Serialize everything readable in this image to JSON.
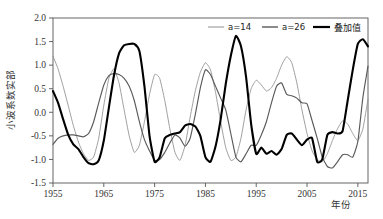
{
  "chart_data": {
    "type": "line",
    "title": "",
    "xlabel": "年份",
    "ylabel": "小波系数实部",
    "xlim": [
      1955,
      2017
    ],
    "ylim": [
      -1.5,
      2.0
    ],
    "grid": false,
    "legend_position": "top-right",
    "xticks": [
      "1955",
      "1965",
      "1975",
      "1985",
      "1995",
      "2005",
      "2015"
    ],
    "xtick_values": [
      1955,
      1965,
      1975,
      1985,
      1995,
      2005,
      2015
    ],
    "yticks": [
      "2.0",
      "1.5",
      "1.0",
      "0.5",
      "0.0",
      "-0.5",
      "-1.0",
      "-1.5"
    ],
    "ytick_values": [
      2.0,
      1.5,
      1.0,
      0.5,
      0.0,
      -0.5,
      -1.0,
      -1.5
    ],
    "x": [
      1955,
      1956,
      1957,
      1958,
      1959,
      1960,
      1961,
      1962,
      1963,
      1964,
      1965,
      1966,
      1967,
      1968,
      1969,
      1970,
      1971,
      1972,
      1973,
      1974,
      1975,
      1976,
      1977,
      1978,
      1979,
      1980,
      1981,
      1982,
      1983,
      1984,
      1985,
      1986,
      1987,
      1988,
      1989,
      1990,
      1991,
      1992,
      1993,
      1994,
      1995,
      1996,
      1997,
      1998,
      1999,
      2000,
      2001,
      2002,
      2003,
      2004,
      2005,
      2006,
      2007,
      2008,
      2009,
      2010,
      2011,
      2012,
      2013,
      2014,
      2015,
      2016,
      2017
    ],
    "series": [
      {
        "name": "a=14",
        "color": "#8f8f8f",
        "width": 0.85,
        "values": [
          1.19,
          0.92,
          0.55,
          0.14,
          -0.28,
          -0.63,
          -0.88,
          -1.02,
          -0.95,
          -0.55,
          0.15,
          0.72,
          0.92,
          0.62,
          0.05,
          -0.5,
          -0.85,
          -0.7,
          -0.2,
          0.38,
          0.8,
          0.72,
          0.25,
          -0.35,
          -0.85,
          -1.02,
          -0.7,
          -0.1,
          0.45,
          0.85,
          1.05,
          0.9,
          0.42,
          -0.2,
          -0.75,
          -1.02,
          -0.95,
          -0.55,
          0.05,
          0.5,
          0.68,
          0.58,
          0.45,
          0.52,
          0.72,
          1.0,
          1.18,
          1.05,
          0.62,
          0.05,
          -0.45,
          -0.82,
          -1.0,
          -1.05,
          -0.88,
          -0.6,
          -0.35,
          -0.18,
          -0.25,
          -0.45,
          -0.6,
          -0.35,
          0.28
        ]
      },
      {
        "name": "a=26",
        "color": "#5a5a5a",
        "width": 1.15,
        "values": [
          -0.68,
          -0.55,
          -0.5,
          -0.48,
          -0.48,
          -0.5,
          -0.52,
          -0.45,
          -0.2,
          0.2,
          0.58,
          0.78,
          0.82,
          0.8,
          0.72,
          0.55,
          0.25,
          -0.2,
          -0.58,
          -0.82,
          -1.02,
          -1.0,
          -0.85,
          -0.65,
          -0.48,
          -0.55,
          -0.72,
          -0.55,
          -0.05,
          0.52,
          0.9,
          0.8,
          0.55,
          0.3,
          0.05,
          -0.45,
          -0.95,
          -1.05,
          -0.88,
          -0.7,
          -0.7,
          -0.48,
          -0.2,
          0.2,
          0.55,
          0.62,
          0.38,
          0.35,
          0.3,
          0.2,
          0.18,
          -0.18,
          -0.55,
          -0.95,
          -1.15,
          -1.18,
          -1.05,
          -0.9,
          -0.9,
          -0.95,
          -0.62,
          0.32,
          0.98
        ]
      },
      {
        "name": "叠加值",
        "color": "#000000",
        "width": 2.1,
        "values": [
          0.45,
          0.2,
          -0.15,
          -0.48,
          -0.68,
          -0.78,
          -0.95,
          -1.08,
          -1.1,
          -1.02,
          -0.6,
          0.1,
          0.78,
          1.25,
          1.42,
          1.45,
          1.45,
          1.3,
          0.55,
          -0.5,
          -1.05,
          -0.95,
          -0.55,
          -0.48,
          -0.45,
          -0.42,
          -0.28,
          -0.25,
          -0.3,
          -0.5,
          -0.95,
          -1.05,
          -0.72,
          -0.15,
          0.6,
          1.2,
          1.62,
          1.4,
          0.75,
          -0.25,
          -0.88,
          -0.75,
          -0.88,
          -0.82,
          -0.9,
          -0.78,
          -0.48,
          -0.45,
          -0.58,
          -0.7,
          -0.58,
          -0.55,
          -1.05,
          -1.0,
          -0.48,
          -0.42,
          -0.45,
          -0.4,
          0.25,
          0.9,
          1.45,
          1.55,
          1.4
        ]
      }
    ]
  },
  "axis": {
    "y_label": "小波系数实部",
    "x_label": "年份"
  },
  "legend": {
    "items": [
      {
        "label": "a=14",
        "color": "#8f8f8f"
      },
      {
        "label": "a=26",
        "color": "#5a5a5a"
      },
      {
        "label": "叠加值",
        "color": "#000000"
      }
    ]
  }
}
